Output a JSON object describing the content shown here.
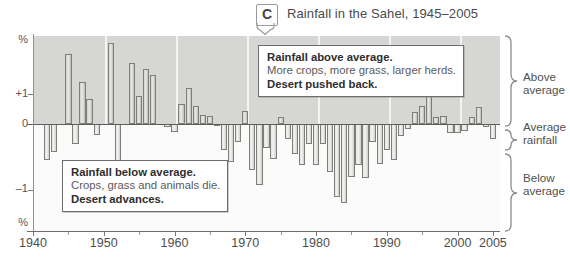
{
  "figure": {
    "badge_label": "C",
    "title": "Rainfall in the Sahel, 1945–2005"
  },
  "axes": {
    "y_unit_top": "%",
    "y_unit_bottom": "%",
    "y_ticks": [
      "+1",
      "0",
      "–1"
    ],
    "x_ticks": [
      "1940",
      "1950",
      "1960",
      "1970",
      "1980",
      "1990",
      "2000",
      "2005"
    ]
  },
  "callouts": {
    "above": {
      "line1": "Rainfall above average.",
      "line2": "More crops, more grass, larger herds.",
      "line3": "Desert pushed back."
    },
    "below": {
      "line1": "Rainfall below average.",
      "line2": "Crops, grass and animals die.",
      "line3": "Desert advances."
    }
  },
  "side_labels": {
    "above": "Above\naverage",
    "above_l1": "Above",
    "above_l2": "average",
    "average_l1": "Average",
    "average_l2": "rainfall",
    "below_l1": "Below",
    "below_l2": "average"
  },
  "colors": {
    "band_above": "#d6d6d4",
    "band_below": "#fbfbfb",
    "bar_fill": "#dedede",
    "bar_stroke": "#7d7d7a",
    "axis": "#5d5d5d",
    "title_text": "#4a4a4a"
  },
  "chart_data": {
    "type": "bar",
    "title": "Rainfall in the Sahel, 1945–2005",
    "xlabel": "",
    "ylabel": "%",
    "xlim": [
      1940,
      2006
    ],
    "ylim": [
      -1.55,
      1.35
    ],
    "grid": "vertical white gridlines at decades, shaded band above zero",
    "legend": [
      "Above average",
      "Average rainfall",
      "Below average"
    ],
    "zero_reference": "Average rainfall (0%)",
    "x": [
      1942,
      1943,
      1944,
      1945,
      1946,
      1947,
      1948,
      1949,
      1950,
      1951,
      1952,
      1953,
      1954,
      1955,
      1956,
      1957,
      1958,
      1959,
      1960,
      1961,
      1962,
      1963,
      1964,
      1965,
      1966,
      1967,
      1968,
      1969,
      1970,
      1971,
      1972,
      1973,
      1974,
      1975,
      1976,
      1977,
      1978,
      1979,
      1980,
      1981,
      1982,
      1983,
      1984,
      1985,
      1986,
      1987,
      1988,
      1989,
      1990,
      1991,
      1992,
      1993,
      1994,
      1995,
      1996,
      1997,
      1998,
      1999,
      2000,
      2001,
      2002,
      2003,
      2004,
      2005
    ],
    "values": [
      -0.55,
      -0.42,
      0.0,
      1.06,
      -0.3,
      0.63,
      0.38,
      -0.17,
      0.0,
      1.22,
      -0.7,
      0.0,
      0.93,
      0.42,
      0.83,
      0.74,
      0.0,
      -0.05,
      -0.12,
      0.3,
      0.55,
      0.27,
      0.14,
      0.12,
      -0.02,
      -0.4,
      -0.57,
      -0.28,
      0.2,
      -0.7,
      -0.92,
      -0.36,
      -0.53,
      0.1,
      -0.22,
      -0.46,
      -0.62,
      -0.3,
      -0.62,
      -0.3,
      -0.72,
      -1.1,
      -1.2,
      -0.8,
      -0.62,
      -0.82,
      -0.28,
      -0.6,
      -0.4,
      -0.55,
      -0.18,
      -0.08,
      0.18,
      0.28,
      0.42,
      0.1,
      0.12,
      -0.14,
      -0.14,
      -0.1,
      0.1,
      0.26,
      -0.05,
      -0.22
    ],
    "units": "percent deviation from average rainfall",
    "annotations": [
      "Rainfall above average. More crops, more grass, larger herds. Desert pushed back.",
      "Rainfall below average. Crops, grass and animals die. Desert advances."
    ]
  }
}
